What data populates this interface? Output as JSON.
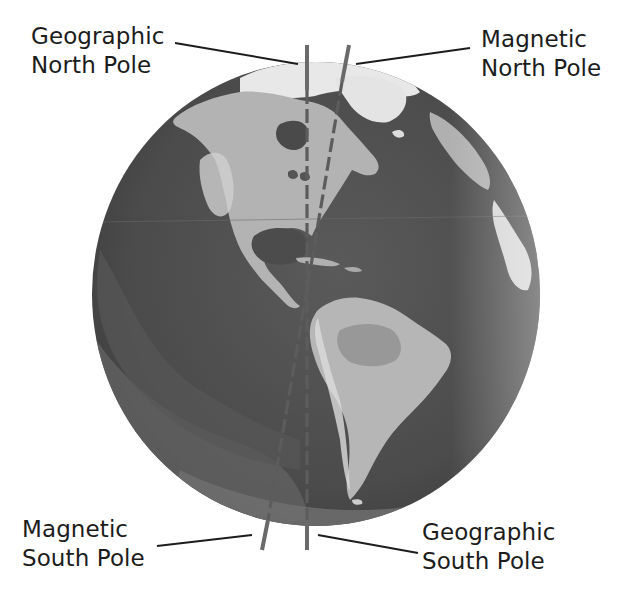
{
  "labels": {
    "geographic_north": {
      "line1": "Geographic",
      "line2": "North Pole"
    },
    "magnetic_north": {
      "line1": "Magnetic",
      "line2": "North Pole"
    },
    "magnetic_south": {
      "line1": "Magnetic",
      "line2": "South Pole"
    },
    "geographic_south": {
      "line1": "Geographic",
      "line2": "South Pole"
    }
  },
  "colors": {
    "ocean_dark": "#4a4a4a",
    "ocean_mid": "#5e5e5e",
    "ocean_light": "#7a7a7a",
    "land": "#b4b4b4",
    "land_light": "#d4d4d4",
    "ice": "#ececec",
    "axis": "#6a6a6a",
    "leader": "#1c1c1c",
    "text": "#1c1c1c"
  },
  "axes": [
    {
      "name": "geographic-axis",
      "style": "solid-outside-dashed-inside",
      "tilt": "vertical"
    },
    {
      "name": "magnetic-axis",
      "style": "solid-outside-dashed-inside",
      "tilt": "tilted"
    }
  ]
}
